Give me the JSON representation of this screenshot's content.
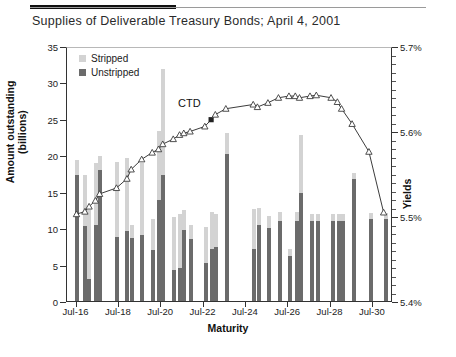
{
  "figure": {
    "title": "Supplies of Deliverable Treasury Bonds; April 4, 2001",
    "annotation": {
      "label": "CTD"
    }
  },
  "legend": {
    "items": [
      {
        "label": "Stripped",
        "color": "#d3d3d3",
        "swatch_name": "legend-swatch-stripped"
      },
      {
        "label": "Unstripped",
        "color": "#6b6b6b",
        "swatch_name": "legend-swatch-unstripped"
      }
    ]
  },
  "axes": {
    "left": {
      "title_line1": "Amount outstanding",
      "title_line2": "(billions)",
      "ticks": [
        "0",
        "5",
        "10",
        "15",
        "20",
        "25",
        "30",
        "35"
      ],
      "min": 0,
      "max": 35,
      "step": 5
    },
    "right": {
      "title": "Yields",
      "ticks": [
        "5.4%",
        "5.5%",
        "5.6%",
        "5.7%"
      ],
      "min": 5.4,
      "max": 5.7,
      "step": 0.1,
      "minor_per_major": 10
    },
    "bottom": {
      "title": "Maturity",
      "ticks": [
        "Jul-16",
        "Jul-18",
        "Jul-20",
        "Jul-22",
        "Jul-24",
        "Jul-26",
        "Jul-28",
        "Jul-30"
      ]
    }
  },
  "chart_data": {
    "type": "bar",
    "title": "Supplies of Deliverable Treasury Bonds; April 4, 2001",
    "xlabel": "Maturity",
    "ylabel": "Amount outstanding (billions)",
    "y2label": "Yields",
    "ylim": [
      0,
      35
    ],
    "y2lim": [
      5.4,
      5.7
    ],
    "grid": false,
    "legend_position": "top-left",
    "stacked": true,
    "categories": [
      "Jul-16",
      "Nov-16",
      "Feb-17",
      "May-17",
      "Aug-17",
      "May-18",
      "Nov-18",
      "Feb-19",
      "Aug-19",
      "Feb-20",
      "May-20",
      "Aug-20",
      "Feb-21",
      "May-21",
      "Aug-21",
      "Nov-21",
      "Aug-22",
      "Nov-22",
      "Feb-23",
      "Aug-23",
      "Nov-24",
      "Feb-25",
      "Aug-25",
      "Feb-26",
      "Aug-26",
      "Nov-26",
      "Feb-27",
      "Aug-27",
      "Nov-27",
      "Aug-28",
      "Nov-28",
      "Feb-29",
      "Aug-29",
      "May-30",
      "Feb-31"
    ],
    "series": [
      {
        "name": "Unstripped",
        "color": "#6b6b6b",
        "values": [
          17.3,
          10.3,
          3.0,
          10.5,
          18.0,
          8.8,
          9.6,
          8.6,
          9.0,
          7.0,
          13.8,
          17.3,
          4.2,
          4.5,
          9.8,
          8.5,
          5.2,
          7.2,
          7.4,
          20.2,
          7.2,
          10.5,
          10.0,
          11.0,
          6.2,
          11.0,
          14.8,
          11.0,
          11.0,
          11.0,
          11.0,
          11.0,
          16.7,
          11.2,
          11.2
        ]
      },
      {
        "name": "Stripped",
        "color": "#d3d3d3",
        "values": [
          2.0,
          7.0,
          9.5,
          8.5,
          1.9,
          10.3,
          10.0,
          1.9,
          9.9,
          4.3,
          9.5,
          14.5,
          7.3,
          7.4,
          2.7,
          2.0,
          5.0,
          5.0,
          4.5,
          2.8,
          5.4,
          2.2,
          1.7,
          1.2,
          1.0,
          1.2,
          8.0,
          1.0,
          0.9,
          0.9,
          0.9,
          0.9,
          0.9,
          0.9,
          0.9
        ]
      }
    ],
    "line_series": {
      "name": "Yields",
      "axis": "right",
      "color": "#3a3a3a",
      "marker": "triangle-open",
      "highlight_index": 17,
      "highlight_label": "CTD",
      "values": [
        5.503,
        5.506,
        5.512,
        5.519,
        5.527,
        5.534,
        5.545,
        5.556,
        5.568,
        5.576,
        5.58,
        5.586,
        5.592,
        5.597,
        5.599,
        5.601,
        5.607,
        5.615,
        5.621,
        5.628,
        5.633,
        5.63,
        5.635,
        5.641,
        5.643,
        5.643,
        5.641,
        5.643,
        5.644,
        5.641,
        5.636,
        5.628,
        5.61,
        5.577,
        5.505
      ]
    }
  }
}
